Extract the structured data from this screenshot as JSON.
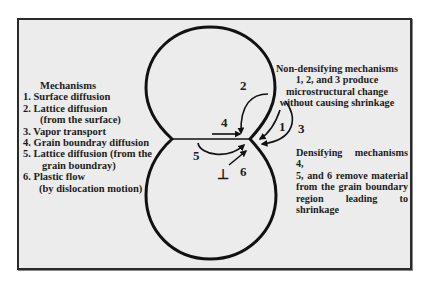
{
  "figure": {
    "type": "sintering-mechanisms-schematic",
    "colors": {
      "frame_background": "#ececec",
      "stroke": "#111111",
      "text": "#1c1c1c"
    }
  },
  "legend": {
    "title": "Mechanisms",
    "items": [
      {
        "line1": "1. Surface diffusion"
      },
      {
        "line1": "2. Lattice diffusion",
        "line2": "(from the surface)"
      },
      {
        "line1": "3. Vapor transport"
      },
      {
        "line1": "4. Grain boundray diffusion"
      },
      {
        "line1": "5. Lattice diffusion (from the",
        "line2": "grain boundray)"
      },
      {
        "line1": "6. Plastic flow",
        "line2": "(by dislocation motion)"
      }
    ]
  },
  "annotations": {
    "non_densifying": {
      "lines": [
        "Non-densifying mechanisms",
        "1, 2, and 3 produce",
        "microstructural change",
        "without causing shrinkage"
      ]
    },
    "densifying": {
      "lines": [
        "Densifying mechanisms 4,",
        "5, and 6 remove material",
        "from the grain boundary",
        "region leading to shrinkage"
      ]
    }
  },
  "arrow_labels": {
    "m1": "1",
    "m2": "2",
    "m3": "3",
    "m4": "4",
    "m5": "5",
    "m6": "6",
    "dislocation_symbol": "⊥"
  }
}
